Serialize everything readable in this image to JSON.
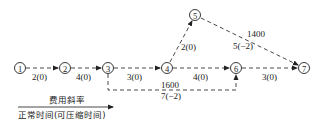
{
  "diagram": {
    "nodes": [
      {
        "id": "1",
        "label": "1"
      },
      {
        "id": "2",
        "label": "2"
      },
      {
        "id": "3",
        "label": "3"
      },
      {
        "id": "4",
        "label": "4"
      },
      {
        "id": "5",
        "label": "5"
      },
      {
        "id": "6",
        "label": "6"
      },
      {
        "id": "7",
        "label": "7"
      }
    ],
    "edges": [
      {
        "from": "1",
        "to": "2",
        "label": "2(0)"
      },
      {
        "from": "2",
        "to": "3",
        "label": "4(0)"
      },
      {
        "from": "3",
        "to": "4",
        "label": "3(0)"
      },
      {
        "from": "4",
        "to": "5",
        "label": "2(0)"
      },
      {
        "from": "5",
        "to": "7",
        "label_top": "1400",
        "label_bottom": "5(−2)"
      },
      {
        "from": "4",
        "to": "6",
        "label": "4(0)"
      },
      {
        "from": "6",
        "to": "7",
        "label": "3(0)"
      },
      {
        "from": "3",
        "to": "6",
        "label_top": "1600",
        "label_bottom": "7(−2)"
      }
    ],
    "legend": {
      "top": "费用斜率",
      "bottom": "正常时间(可压缩时间)"
    }
  }
}
